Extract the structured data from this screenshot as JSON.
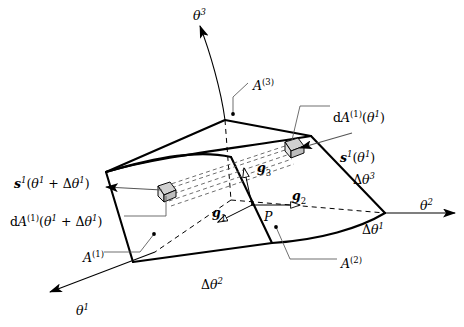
{
  "figure": {
    "kind": "curvilinear-control-volume-diagram",
    "background_color": "#ffffff",
    "line_color": "#000000",
    "leader_color": "#555555",
    "patch_fill": "#d0d0d0"
  },
  "axes": [
    {
      "id": "theta3",
      "base": "θ",
      "superscript": "3",
      "x": 193,
      "y": 8,
      "direction": "up"
    },
    {
      "id": "theta2",
      "base": "θ",
      "superscript": "2",
      "x": 420,
      "y": 198,
      "direction": "right"
    },
    {
      "id": "theta1",
      "base": "θ",
      "superscript": "1",
      "x": 76,
      "y": 303,
      "direction": "down-left"
    }
  ],
  "surface_labels": [
    {
      "id": "A3",
      "base": "A",
      "superscript": "(3)",
      "x": 253,
      "y": 78,
      "note": "top surface"
    },
    {
      "id": "A1",
      "base": "A",
      "superscript": "(1)",
      "x": 83,
      "y": 250,
      "note": "left front surface"
    },
    {
      "id": "A2",
      "base": "A",
      "superscript": "(2)",
      "x": 341,
      "y": 256,
      "note": "right front surface"
    }
  ],
  "increment_labels": [
    {
      "id": "dtheta3",
      "delta": "Δ",
      "base": "θ",
      "superscript": "3",
      "x": 353,
      "y": 172
    },
    {
      "id": "dtheta1",
      "delta": "Δ",
      "base": "θ",
      "superscript": "1",
      "x": 362,
      "y": 222
    },
    {
      "id": "dtheta2",
      "delta": "Δ",
      "base": "θ",
      "superscript": "2",
      "x": 201,
      "y": 277
    }
  ],
  "basis_vectors": [
    {
      "id": "g1",
      "base": "g",
      "subscript": "1",
      "x": 212,
      "y": 207,
      "note": "covariant base vector 1"
    },
    {
      "id": "g2",
      "base": "g",
      "subscript": "2",
      "x": 292,
      "y": 190,
      "note": "covariant base vector 2"
    },
    {
      "id": "g3",
      "base": "g",
      "subscript": "3",
      "x": 257,
      "y": 162,
      "note": "covariant base vector 3"
    }
  ],
  "point_label": {
    "id": "P",
    "text": "P",
    "x": 264,
    "y": 211
  },
  "traction_labels": [
    {
      "id": "s1-theta1",
      "vector": "s",
      "vector_superscript": "1",
      "arg_open": "(",
      "arg": "θ",
      "arg_superscript": "1",
      "arg_close": ")",
      "x": 340,
      "y": 150
    },
    {
      "id": "s1-theta1-plus-dtheta1",
      "vector": "s",
      "vector_superscript": "1",
      "arg_open": "(",
      "arg": "θ",
      "arg_superscript": "1",
      "plus": "+",
      "delta": "Δ",
      "arg2": "θ",
      "arg2_superscript": "1",
      "arg_close": ")",
      "x": 14,
      "y": 176
    }
  ],
  "area_element_labels": [
    {
      "id": "dA1-theta1",
      "d": "d",
      "base": "A",
      "superscript": "(1)",
      "arg_open": "(",
      "arg": "θ",
      "arg_superscript": "1",
      "arg_close": ")",
      "x": 333,
      "y": 110
    },
    {
      "id": "dA1-theta1-plus-dtheta1",
      "d": "d",
      "base": "A",
      "superscript": "(1)",
      "arg_open": "(",
      "arg": "θ",
      "arg_superscript": "1",
      "plus": "+",
      "delta": "Δ",
      "arg2": "θ",
      "arg2_superscript": "1",
      "arg_close": ")",
      "x": 10,
      "y": 214
    }
  ]
}
